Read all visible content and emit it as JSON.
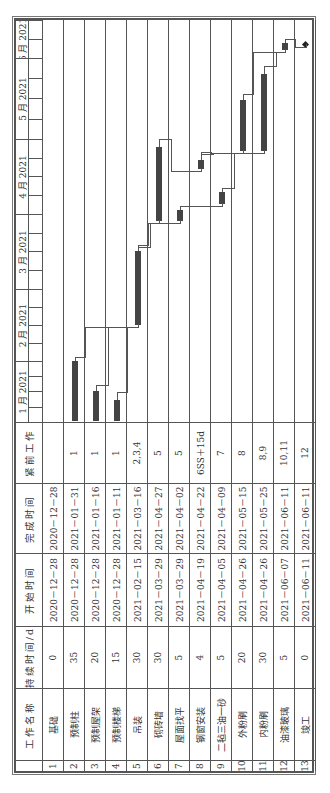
{
  "table": {
    "headers": {
      "index": "",
      "name": "工作名称",
      "duration": "持续时间/d",
      "start": "开始时间",
      "finish": "完成时间",
      "pred": "紧前工作"
    },
    "rows": [
      {
        "id": "1",
        "name": "基础",
        "duration": "0",
        "start": "2020－12－28",
        "finish": "2020－12－28",
        "pred": ""
      },
      {
        "id": "2",
        "name": "预制柱",
        "duration": "35",
        "start": "2020－12－28",
        "finish": "2021－01－31",
        "pred": "1"
      },
      {
        "id": "3",
        "name": "预制屋架",
        "duration": "20",
        "start": "2020－12－28",
        "finish": "2021－01－16",
        "pred": "1"
      },
      {
        "id": "4",
        "name": "预制楼梯",
        "duration": "15",
        "start": "2020－12－28",
        "finish": "2021－01－11",
        "pred": "1"
      },
      {
        "id": "5",
        "name": "吊装",
        "duration": "30",
        "start": "2021－02－15",
        "finish": "2021－03－16",
        "pred": "2,3,4"
      },
      {
        "id": "6",
        "name": "砌砖墙",
        "duration": "30",
        "start": "2021－03－29",
        "finish": "2021－04－27",
        "pred": "5"
      },
      {
        "id": "7",
        "name": "屋面找平",
        "duration": "5",
        "start": "2021－03－29",
        "finish": "2021－04－02",
        "pred": "5"
      },
      {
        "id": "8",
        "name": "钢窗安装",
        "duration": "4",
        "start": "2021－04－19",
        "finish": "2021－04－22",
        "pred": "6SS＋15d"
      },
      {
        "id": "9",
        "name": "二毡三油一砂",
        "duration": "5",
        "start": "2021－04－05",
        "finish": "2021－04－09",
        "pred": "7"
      },
      {
        "id": "10",
        "name": "外粉刷",
        "duration": "20",
        "start": "2021－04－26",
        "finish": "2021－05－15",
        "pred": "8"
      },
      {
        "id": "11",
        "name": "内粉刷",
        "duration": "30",
        "start": "2021－04－26",
        "finish": "2021－05－25",
        "pred": "8,9"
      },
      {
        "id": "12",
        "name": "油漆玻璃",
        "duration": "5",
        "start": "2021－06－07",
        "finish": "2021－06－11",
        "pred": "10,11"
      },
      {
        "id": "13",
        "name": "竣工",
        "duration": "0",
        "start": "2021－06－11",
        "finish": "2021－06－11",
        "pred": "12"
      }
    ]
  },
  "chart_data": {
    "type": "gantt",
    "title": "",
    "months": [
      "1 月 2021",
      "2 月 2021",
      "3 月 2021",
      "4 月 2021",
      "5 月 2021",
      "6 月 2021"
    ],
    "bars": [
      {
        "row": 1,
        "name": "基础",
        "start": "2020-12-28",
        "end": "2020-12-28",
        "milestone": true,
        "visible": false
      },
      {
        "row": 2,
        "name": "预制柱",
        "start": "2020-12-28",
        "end": "2021-01-31"
      },
      {
        "row": 3,
        "name": "预制屋架",
        "start": "2020-12-28",
        "end": "2021-01-16"
      },
      {
        "row": 4,
        "name": "预制楼梯",
        "start": "2020-12-28",
        "end": "2021-01-11"
      },
      {
        "row": 5,
        "name": "吊装",
        "start": "2021-02-15",
        "end": "2021-03-16"
      },
      {
        "row": 6,
        "name": "砌砖墙",
        "start": "2021-03-29",
        "end": "2021-04-27"
      },
      {
        "row": 7,
        "name": "屋面找平",
        "start": "2021-03-29",
        "end": "2021-04-02"
      },
      {
        "row": 8,
        "name": "钢窗安装",
        "start": "2021-04-19",
        "end": "2021-04-22"
      },
      {
        "row": 9,
        "name": "二毡三油一砂",
        "start": "2021-04-05",
        "end": "2021-04-09"
      },
      {
        "row": 10,
        "name": "外粉刷",
        "start": "2021-04-26",
        "end": "2021-05-15"
      },
      {
        "row": 11,
        "name": "内粉刷",
        "start": "2021-04-26",
        "end": "2021-05-25"
      },
      {
        "row": 12,
        "name": "油漆玻璃",
        "start": "2021-06-07",
        "end": "2021-06-11"
      },
      {
        "row": 13,
        "name": "竣工",
        "start": "2021-06-11",
        "end": "2021-06-11",
        "milestone": true
      }
    ],
    "links": [
      [
        2,
        5
      ],
      [
        3,
        5
      ],
      [
        4,
        5
      ],
      [
        5,
        6
      ],
      [
        5,
        7
      ],
      [
        6,
        8
      ],
      [
        7,
        9
      ],
      [
        8,
        10
      ],
      [
        8,
        11
      ],
      [
        9,
        11
      ],
      [
        10,
        12
      ],
      [
        11,
        12
      ],
      [
        12,
        13
      ]
    ],
    "orientation": "rotated -90deg"
  }
}
